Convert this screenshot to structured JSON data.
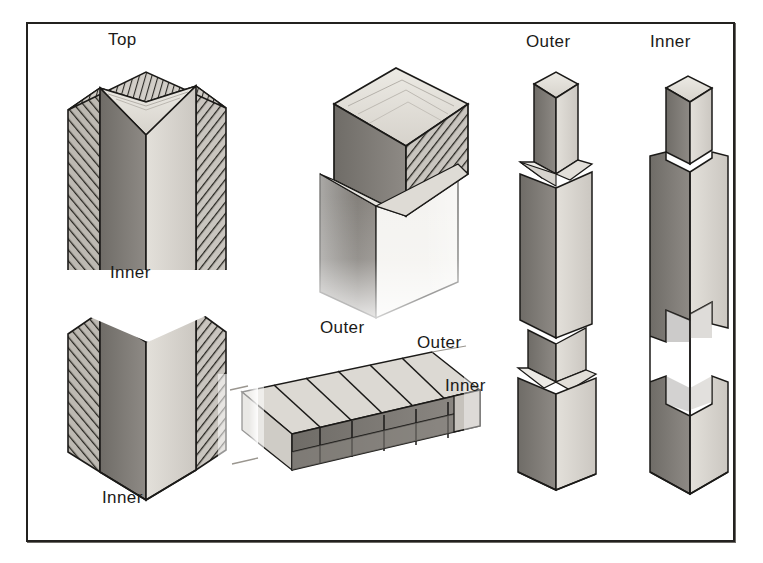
{
  "plate": {
    "kind": "technical-illustration",
    "subject": "timber column joinery details",
    "background_color": "#ffffff",
    "frame_color": "#23211f",
    "ink_color": "#1b1a18"
  },
  "palette": {
    "ink": "#1b1a18",
    "hatch": "#2e2c29",
    "face_dark": "#7d7a75",
    "face_mid": "#a8a49e",
    "face_light": "#d8d5cf",
    "face_lightest": "#ecebe6",
    "face_shadow": "#5d5a56",
    "paper": "#ffffff"
  },
  "figures": [
    {
      "id": "fig-1",
      "name": "built-up-column-broken-view",
      "description": "Tall square built-up column shown in broken (interrupted) elevation with hatched outer laminations and a lighter inner core; top end grain visible.",
      "labels": [
        "Top",
        "Inner",
        "Inner"
      ]
    },
    {
      "id": "fig-2",
      "name": "column-cap-joint-detail",
      "description": "Isometric detail of a square cap block seated on the top of a post, the right cheek shown hatched as a sawn face; lower post fades out.",
      "labels": [
        "Outer"
      ]
    },
    {
      "id": "fig-3",
      "name": "laminated-beam-detail",
      "description": "Isometric detail of a laminated horizontal member: the top surface shows raking lamination lines, the front face shows stacked blocks.",
      "labels": [
        "Outer",
        "Outer",
        "Inner"
      ]
    },
    {
      "id": "fig-4",
      "name": "outer-post-member",
      "description": "Slender outer post with reduced tenon at the head and two collared shoulders breaking the shaft into three stages.",
      "labels": [
        "Outer"
      ]
    },
    {
      "id": "fig-5",
      "name": "inner-post-member",
      "description": "Slender inner post with reduced tenon at the head and shallow notched housings cut into both visible faces near mid-height and low down.",
      "labels": [
        "Inner"
      ]
    }
  ],
  "labels": [
    {
      "id": "label-top",
      "text": "Top",
      "figure": "fig-1",
      "x": 106,
      "y": 28
    },
    {
      "id": "label-inner-break",
      "text": "Inner",
      "figure": "fig-1",
      "x": 108,
      "y": 261
    },
    {
      "id": "label-inner-bottom",
      "text": "Inner",
      "figure": "fig-1",
      "x": 100,
      "y": 486
    },
    {
      "id": "label-outer-cap",
      "text": "Outer",
      "figure": "fig-2",
      "x": 318,
      "y": 316
    },
    {
      "id": "label-outer-beam",
      "text": "Outer",
      "figure": "fig-3",
      "x": 415,
      "y": 331
    },
    {
      "id": "label-inner-beam",
      "text": "Inner",
      "figure": "fig-3",
      "x": 443,
      "y": 374
    },
    {
      "id": "label-outer-post",
      "text": "Outer",
      "figure": "fig-4",
      "x": 524,
      "y": 30
    },
    {
      "id": "label-inner-post",
      "text": "Inner",
      "figure": "fig-5",
      "x": 648,
      "y": 30
    }
  ]
}
